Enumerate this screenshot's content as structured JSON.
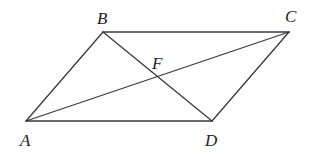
{
  "diagram": {
    "type": "parallelogram-with-diagonals",
    "stroke_color": "#3a3a3a",
    "label_color": "#222222",
    "points": {
      "A": {
        "x": 26,
        "y": 121
      },
      "B": {
        "x": 103,
        "y": 32
      },
      "C": {
        "x": 289,
        "y": 32
      },
      "D": {
        "x": 212,
        "y": 121
      },
      "F": {
        "x": 157,
        "y": 77
      }
    },
    "labels": {
      "A": {
        "text": "A",
        "x": 20,
        "y": 146
      },
      "B": {
        "text": "B",
        "x": 97,
        "y": 24
      },
      "C": {
        "text": "C",
        "x": 285,
        "y": 22
      },
      "D": {
        "text": "D",
        "x": 205,
        "y": 146
      },
      "F": {
        "text": "F",
        "x": 152,
        "y": 69
      }
    },
    "segments": [
      {
        "name": "AB",
        "from": "A",
        "to": "B"
      },
      {
        "name": "BC",
        "from": "B",
        "to": "C"
      },
      {
        "name": "CD",
        "from": "C",
        "to": "D"
      },
      {
        "name": "DA",
        "from": "D",
        "to": "A"
      },
      {
        "name": "AC",
        "from": "A",
        "to": "C"
      },
      {
        "name": "BD",
        "from": "B",
        "to": "D"
      }
    ]
  }
}
